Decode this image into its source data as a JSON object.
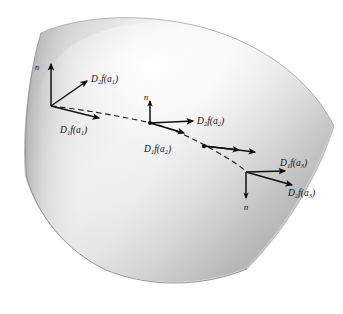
{
  "figure": {
    "kind": "surface-tangent-frames",
    "background_color": "#ffffff",
    "surface": {
      "fill_light": "#fdfdfd",
      "fill_mid": "#d8d8d8",
      "fill_dark": "#a8a8a8",
      "outline_color": "#8f8f8f"
    },
    "curve": {
      "style": "dashed",
      "color": "#1a1a1a"
    },
    "arrow_color": "#111111"
  },
  "frames": [
    {
      "id": "frame-a1",
      "point_label": "a1",
      "normal": {
        "name": "n",
        "label": "n",
        "direction": "up"
      },
      "vectors": [
        {
          "name": "D2f(a1)",
          "base": "D",
          "sub": "2",
          "fn": "f(a",
          "arg_sub": "1",
          "close": ")",
          "label_main": "D",
          "label_sub1": "2",
          "label_mid": "f(a",
          "label_sub2": "1",
          "label_end": ")",
          "direction": "up-right"
        },
        {
          "name": "D1f(a1)",
          "label_main": "D",
          "label_sub1": "1",
          "label_mid": "f(a",
          "label_sub2": "1",
          "label_end": ")",
          "direction": "right-slight-down"
        }
      ]
    },
    {
      "id": "frame-a2",
      "point_label": "a2",
      "normal": {
        "name": "n",
        "label": "n",
        "direction": "up"
      },
      "vectors": [
        {
          "name": "D2f(a2)",
          "label_main": "D",
          "label_sub1": "2",
          "label_mid": "f(a",
          "label_sub2": "2",
          "label_end": ")",
          "direction": "right"
        },
        {
          "name": "D1f(a2)",
          "label_main": "D",
          "label_sub1": "1",
          "label_mid": "f(a",
          "label_sub2": "2",
          "label_end": ")",
          "direction": "right-down"
        }
      ]
    },
    {
      "id": "frame-mid",
      "point_label": "",
      "normal": null,
      "vectors": [
        {
          "name": "unlabeled-tangent-a",
          "label_main": "",
          "label_sub1": "",
          "label_mid": "",
          "label_sub2": "",
          "label_end": "",
          "direction": "right"
        },
        {
          "name": "unlabeled-tangent-b",
          "label_main": "",
          "label_sub1": "",
          "label_mid": "",
          "label_sub2": "",
          "label_end": "",
          "direction": "right"
        }
      ]
    },
    {
      "id": "frame-a3",
      "point_label": "a3",
      "normal": {
        "name": "n",
        "label": "n",
        "direction": "down"
      },
      "vectors": [
        {
          "name": "D1f(a3)",
          "label_main": "D",
          "label_sub1": "1",
          "label_mid": "f(a",
          "label_sub2": "3",
          "label_end": ")",
          "direction": "right"
        },
        {
          "name": "D2f(a3)",
          "label_main": "D",
          "label_sub1": "2",
          "label_mid": "f(a",
          "label_sub2": "3",
          "label_end": ")",
          "direction": "right-down"
        }
      ]
    }
  ],
  "labels": {
    "n1": "n",
    "n2": "n",
    "n3": "n",
    "d2fa1_main": "D",
    "d2fa1_sub1": "2",
    "d2fa1_mid": "f(a",
    "d2fa1_sub2": "1",
    "d2fa1_end": ")",
    "d1fa1_main": "D",
    "d1fa1_sub1": "1",
    "d1fa1_mid": "f(a",
    "d1fa1_sub2": "1",
    "d1fa1_end": ")",
    "d2fa2_main": "D",
    "d2fa2_sub1": "2",
    "d2fa2_mid": "f(a",
    "d2fa2_sub2": "2",
    "d2fa2_end": ")",
    "d1fa2_main": "D",
    "d1fa2_sub1": "1",
    "d1fa2_mid": "f(a",
    "d1fa2_sub2": "2",
    "d1fa2_end": ")",
    "d1fa3_main": "D",
    "d1fa3_sub1": "1",
    "d1fa3_mid": "f(a",
    "d1fa3_sub2": "3",
    "d1fa3_end": ")",
    "d2fa3_main": "D",
    "d2fa3_sub1": "2",
    "d2fa3_mid": "f(a",
    "d2fa3_sub2": "3",
    "d2fa3_end": ")"
  }
}
